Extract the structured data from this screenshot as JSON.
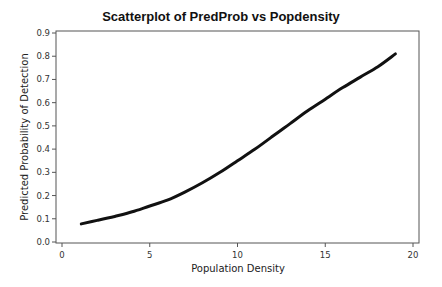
{
  "chart_data": {
    "type": "line",
    "title": "Scatterplot of PredProb vs Popdensity",
    "xlabel": "Population Density",
    "ylabel": "Predicted Probability of Detection",
    "xlim": [
      0,
      20
    ],
    "ylim": [
      0.0,
      0.9
    ],
    "xticks": [
      "0",
      "5",
      "10",
      "15",
      "20"
    ],
    "yticks": [
      "0.0",
      "0.1",
      "0.2",
      "0.3",
      "0.4",
      "0.5",
      "0.6",
      "0.7",
      "0.8",
      "0.9"
    ],
    "grid": false,
    "legend": null,
    "series": [
      {
        "name": "PredProb",
        "x": [
          1.1,
          2,
          3,
          4,
          5,
          6,
          7,
          8,
          9,
          10,
          11,
          12,
          13,
          14,
          15,
          16,
          17,
          18,
          19
        ],
        "values": [
          0.078,
          0.093,
          0.11,
          0.13,
          0.155,
          0.18,
          0.215,
          0.255,
          0.3,
          0.35,
          0.4,
          0.455,
          0.51,
          0.565,
          0.615,
          0.665,
          0.71,
          0.755,
          0.81
        ]
      }
    ]
  }
}
